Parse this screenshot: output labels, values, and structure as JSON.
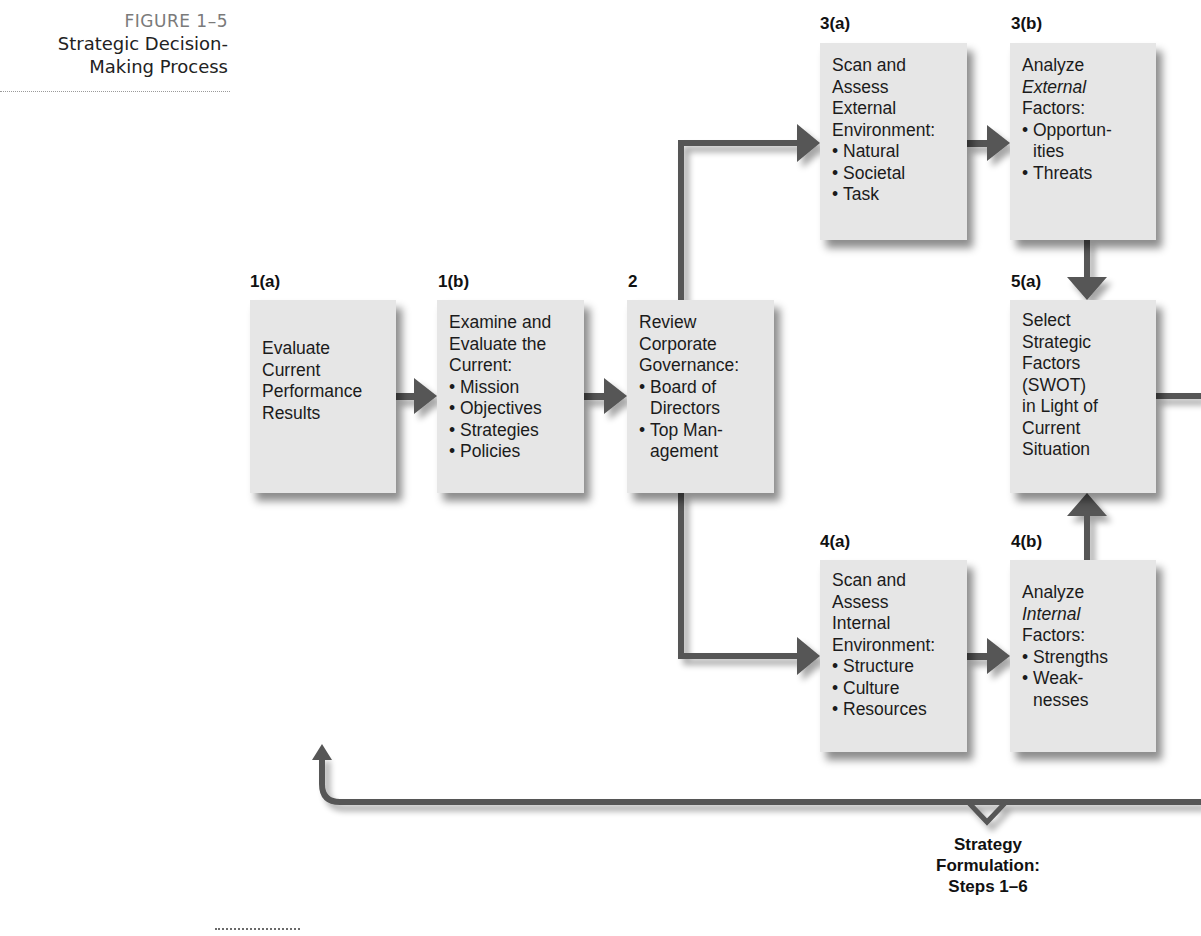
{
  "figure": {
    "number": "FIGURE 1–5",
    "title_line1": "Strategic Decision-",
    "title_line2": "Making Process"
  },
  "steps": {
    "s1a": {
      "label": "1(a)",
      "lines": [
        "Evaluate",
        "Current",
        "Performance",
        "Results"
      ]
    },
    "s1b": {
      "label": "1(b)",
      "lines": [
        "Examine and",
        "Evaluate the",
        "Current:"
      ],
      "bullets": [
        "Mission",
        "Objectives",
        "Strategies",
        "Policies"
      ]
    },
    "s2": {
      "label": "2",
      "lines": [
        "Review",
        "Corporate",
        "Governance:"
      ],
      "bullets": [
        "Board of",
        "Directors",
        "Top Man-",
        "agement"
      ]
    },
    "s3a": {
      "label": "3(a)",
      "lines": [
        "Scan and",
        "Assess",
        "External",
        "Environment:"
      ],
      "bullets": [
        "Natural",
        "Societal",
        "Task"
      ]
    },
    "s3b": {
      "label": "3(b)",
      "lines": [
        "Analyze",
        "External",
        "Factors:"
      ],
      "bullets": [
        "Opportun-",
        "ities",
        "Threats"
      ]
    },
    "s4a": {
      "label": "4(a)",
      "lines": [
        "Scan and",
        "Assess",
        "Internal",
        "Environment:"
      ],
      "bullets": [
        "Structure",
        "Culture",
        "Resources"
      ]
    },
    "s4b": {
      "label": "4(b)",
      "lines": [
        "Analyze",
        "Internal",
        "Factors:"
      ],
      "bullets": [
        "Strengths",
        "Weak-",
        "nesses"
      ]
    },
    "s5a": {
      "label": "5(a)",
      "lines": [
        "Select",
        "Strategic",
        "Factors",
        "(SWOT)",
        "in Light of",
        "Current",
        "Situation"
      ]
    }
  },
  "bracket_caption": {
    "line1": "Strategy",
    "line2": "Formulation:",
    "line3": "Steps 1–6"
  },
  "colors": {
    "box_fill": "#e6e6e6",
    "arrow": "#555555",
    "header_gray": "#7a7a7a"
  }
}
